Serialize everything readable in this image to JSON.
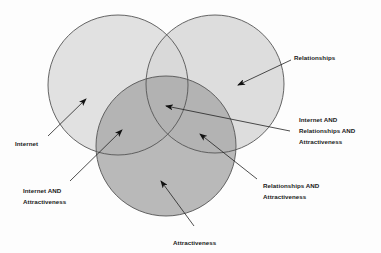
{
  "diagram": {
    "type": "venn",
    "sets": [
      {
        "id": "internet",
        "label": "Internet",
        "fill": "#dcdcdc"
      },
      {
        "id": "relationships",
        "label": "Relationships",
        "fill": "#d7d7d7"
      },
      {
        "id": "attractiveness",
        "label": "Attractiveness",
        "fill": "#a9a9a9"
      }
    ],
    "stroke_color": "#555555",
    "annotations": [
      {
        "id": "internet",
        "lines": [
          "Internet"
        ]
      },
      {
        "id": "relationships",
        "lines": [
          "Relationships"
        ]
      },
      {
        "id": "all-three",
        "lines": [
          "Internet AND",
          "Relationships AND",
          "Attractiveness"
        ]
      },
      {
        "id": "internet-attractiveness",
        "lines": [
          "Internet AND",
          "Attractiveness"
        ]
      },
      {
        "id": "relationships-attractiveness",
        "lines": [
          "Relationships AND",
          "Attractiveness"
        ]
      },
      {
        "id": "attractiveness",
        "lines": [
          "Attractiveness"
        ]
      }
    ]
  }
}
